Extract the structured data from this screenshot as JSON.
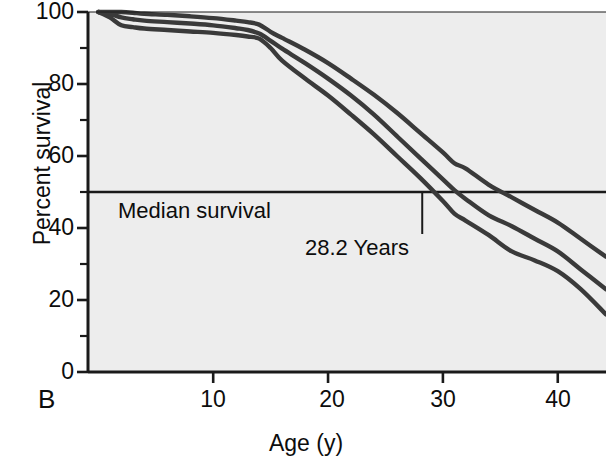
{
  "panel": {
    "label": "B"
  },
  "axes": {
    "ylabel": "Percent survival",
    "xlabel": "Age (y)",
    "yticks": [
      "100",
      "80",
      "60",
      "40",
      "20",
      "0"
    ],
    "xticks": [
      "10",
      "20",
      "30",
      "40"
    ]
  },
  "annotations": {
    "median_label": "Median survival",
    "median_value_label": "28.2 Years"
  },
  "colors": {
    "plot_background": "#ededed",
    "curve": "#3a3a3a",
    "axis": "#1a1a1a",
    "text": "#0d0d0d"
  },
  "chart_data": {
    "type": "line",
    "title": "",
    "xlabel": "Age (y)",
    "ylabel": "Percent survival",
    "xlim": [
      -0.9,
      44.2
    ],
    "ylim": [
      0,
      100
    ],
    "xticks": [
      10,
      20,
      30,
      40
    ],
    "yticks": [
      0,
      20,
      40,
      60,
      80,
      100
    ],
    "yminorticks": [
      10,
      30,
      50,
      70,
      90
    ],
    "grid": false,
    "legend": "none",
    "reference_lines": [
      {
        "orientation": "horizontal",
        "y": 50,
        "label": "Median survival"
      }
    ],
    "point_annotations": [
      {
        "x": 28.2,
        "y": 50,
        "label": "28.2 Years"
      }
    ],
    "series": [
      {
        "name": "upper",
        "x": [
          0,
          1,
          2,
          3,
          4,
          6,
          8,
          10,
          12,
          13,
          14,
          15,
          16,
          18,
          20,
          22,
          24,
          26,
          28,
          30,
          31,
          32,
          34,
          36,
          38,
          40,
          42,
          44.2
        ],
        "values": [
          100,
          100,
          100,
          99.8,
          99.5,
          99.2,
          98.8,
          98.3,
          97.6,
          97.2,
          96.5,
          94.5,
          92.8,
          89.5,
          85.8,
          81.5,
          77.0,
          72.0,
          66.5,
          61.0,
          58.0,
          56.5,
          52.0,
          48.5,
          45.0,
          41.5,
          37.0,
          32.0
        ]
      },
      {
        "name": "middle",
        "x": [
          0,
          1,
          2,
          3,
          4,
          6,
          8,
          10,
          12,
          13,
          14,
          15,
          16,
          18,
          20,
          22,
          24,
          26,
          28,
          30,
          31,
          32,
          34,
          36,
          38,
          40,
          42,
          44.2
        ],
        "values": [
          100,
          99.5,
          98.5,
          98.0,
          97.6,
          97.2,
          96.8,
          96.3,
          95.5,
          95.0,
          94.0,
          92.0,
          89.8,
          85.8,
          81.5,
          76.8,
          71.5,
          65.5,
          59.5,
          53.5,
          50.5,
          48.0,
          43.5,
          40.5,
          37.0,
          33.5,
          28.5,
          23.0
        ]
      },
      {
        "name": "lower",
        "x": [
          0,
          1,
          2,
          3,
          4,
          6,
          8,
          10,
          12,
          13,
          14,
          15,
          16,
          18,
          20,
          22,
          24,
          26,
          28,
          30,
          31,
          32,
          34,
          36,
          38,
          40,
          42,
          44.2
        ],
        "values": [
          100,
          98.5,
          96.3,
          95.8,
          95.4,
          95.0,
          94.6,
          94.2,
          93.6,
          93.2,
          92.6,
          90.0,
          86.5,
          81.5,
          76.8,
          71.5,
          66.0,
          60.0,
          54.0,
          47.5,
          44.0,
          42.0,
          38.0,
          33.5,
          31.0,
          28.0,
          23.0,
          16.0
        ]
      }
    ]
  }
}
